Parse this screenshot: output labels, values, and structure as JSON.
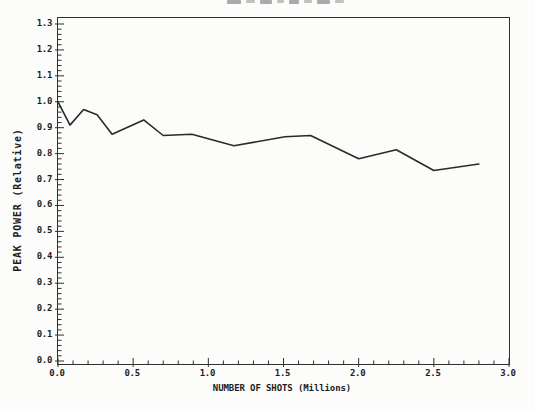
{
  "page": {
    "cropped_title_fragment": {
      "marks": [
        14,
        9,
        12,
        7,
        10,
        8,
        13,
        9
      ]
    }
  },
  "colors": {
    "line": "#2a2a2a",
    "axis": "#2f2f2f",
    "text": "#1d1d1d",
    "background": "#fcfcfb",
    "fragment": "#8f8f8f"
  },
  "chart_data": {
    "type": "line",
    "title": "",
    "xlabel": "NUMBER OF SHOTS (Millions)",
    "ylabel": "PEAK POWER (Relative)",
    "xlim": [
      0.0,
      3.0
    ],
    "ylim": [
      0.0,
      1.3
    ],
    "x_tick_labels": [
      "0.0",
      "0.5",
      "1.0",
      "1.5",
      "2.0",
      "2.5",
      "3.0"
    ],
    "y_tick_labels": [
      "0.0",
      "0.1",
      "0.2",
      "0.3",
      "0.4",
      "0.5",
      "0.6",
      "0.7",
      "0.8",
      "0.9",
      "1.0",
      "1.1",
      "1.2",
      "1.3"
    ],
    "x_minor_step": 0.1,
    "y_minor_step": 0.02,
    "grid": false,
    "legend": "none",
    "series": [
      {
        "name": "peak-power",
        "x": [
          0.0,
          0.08,
          0.17,
          0.26,
          0.36,
          0.57,
          0.7,
          0.89,
          1.17,
          1.51,
          1.68,
          2.0,
          2.25,
          2.5,
          2.8
        ],
        "y": [
          1.0,
          0.91,
          0.97,
          0.95,
          0.875,
          0.93,
          0.87,
          0.875,
          0.83,
          0.865,
          0.87,
          0.78,
          0.815,
          0.735,
          0.76
        ]
      }
    ]
  }
}
